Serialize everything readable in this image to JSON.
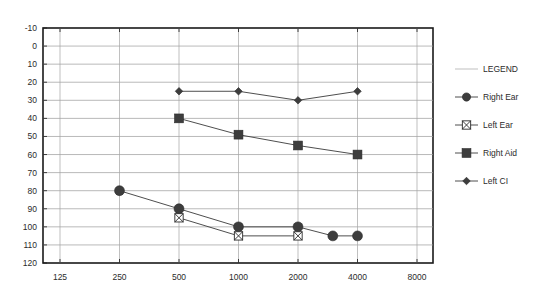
{
  "chart_data": {
    "type": "line",
    "title": "",
    "subtitle": "",
    "xlabel": "",
    "ylabel": "",
    "x_scale": "log-frequency",
    "grid": true,
    "legend_position": "right",
    "legend_title": "LEGEND",
    "categories": [
      125,
      250,
      500,
      1000,
      2000,
      4000,
      8000
    ],
    "x_tick_labels": [
      "125",
      "250",
      "500",
      "1000",
      "2000",
      "4000",
      "8000"
    ],
    "y_tick_labels": [
      "-10",
      "0",
      "10",
      "20",
      "30",
      "40",
      "50",
      "60",
      "70",
      "80",
      "90",
      "100",
      "110",
      "120"
    ],
    "y_ticks": [
      -10,
      0,
      10,
      20,
      30,
      40,
      50,
      60,
      70,
      80,
      90,
      100,
      110,
      120
    ],
    "ylim": [
      -10,
      120
    ],
    "y_inverted": true,
    "series": [
      {
        "name": "Right Ear",
        "marker": "filled-circle",
        "points": [
          {
            "x": 250,
            "y": 80
          },
          {
            "x": 500,
            "y": 90
          },
          {
            "x": 1000,
            "y": 100
          },
          {
            "x": 2000,
            "y": 100
          },
          {
            "x": 3000,
            "y": 105
          },
          {
            "x": 4000,
            "y": 105
          }
        ]
      },
      {
        "name": "Left Ear",
        "marker": "square-with-x",
        "points": [
          {
            "x": 500,
            "y": 95
          },
          {
            "x": 1000,
            "y": 105
          },
          {
            "x": 2000,
            "y": 105
          }
        ]
      },
      {
        "name": "Right Aid",
        "marker": "filled-square",
        "points": [
          {
            "x": 500,
            "y": 40
          },
          {
            "x": 1000,
            "y": 49
          },
          {
            "x": 2000,
            "y": 55
          },
          {
            "x": 4000,
            "y": 60
          }
        ]
      },
      {
        "name": "Left CI",
        "marker": "filled-diamond",
        "points": [
          {
            "x": 500,
            "y": 25
          },
          {
            "x": 1000,
            "y": 25
          },
          {
            "x": 2000,
            "y": 30
          },
          {
            "x": 4000,
            "y": 25
          }
        ]
      }
    ]
  },
  "legend": {
    "header": "LEGEND",
    "entries": [
      {
        "label": "Right Ear",
        "marker": "filled-circle"
      },
      {
        "label": "Left Ear",
        "marker": "square-with-x"
      },
      {
        "label": "Right Aid",
        "marker": "filled-square"
      },
      {
        "label": "Left CI",
        "marker": "filled-diamond"
      }
    ]
  },
  "colors": {
    "marker": "#3d3d3d",
    "line": "#3a3a3a",
    "grid": "#9b9b9b",
    "border": "#1a1a1a",
    "text": "#2b2b2b",
    "background": "#ffffff"
  }
}
